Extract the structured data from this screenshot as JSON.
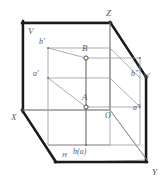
{
  "figure": {
    "background_color": "#ffffff",
    "thick_edge_color": "#1a1a1a",
    "thin_line_color": "#8a8a8a",
    "label_color": "#5a5a5a",
    "point_fill_color": "#ffffff",
    "point_stroke_color": "#3a3a3a"
  },
  "planes": {
    "vertical_label": "V",
    "side_label": "W",
    "horizontal_label": "H"
  },
  "axes": {
    "x_label": "X",
    "y_label": "Y",
    "z_label": "Z",
    "origin_label": "O"
  },
  "points": {
    "a_space": "A",
    "b_space": "B",
    "a_front": "a'",
    "b_front": "b'",
    "a_side": "a\"",
    "b_side": "b\"",
    "ba_horizontal": "b(a)"
  }
}
